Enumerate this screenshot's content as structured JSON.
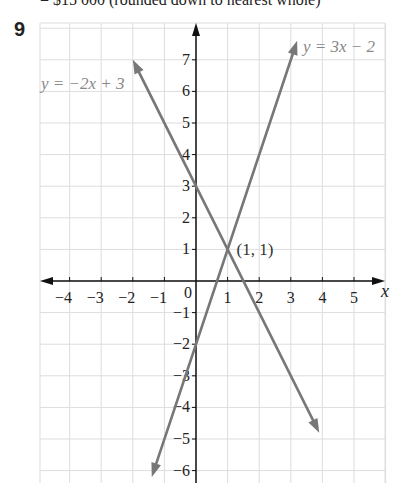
{
  "header": {
    "partial_text": "= $15 000 (rounded down to nearest whole)",
    "question_number": "9"
  },
  "chart_data": {
    "type": "line",
    "title": "",
    "xlabel": "x",
    "ylabel": "",
    "xlim": [
      -4.5,
      5.5
    ],
    "ylim": [
      -6.3,
      7.8
    ],
    "grid": true,
    "x_ticks": [
      -4,
      -3,
      -2,
      -1,
      1,
      2,
      3,
      4,
      5
    ],
    "y_ticks": [
      -6,
      -5,
      -4,
      -3,
      -2,
      -1,
      1,
      2,
      3,
      4,
      5,
      6,
      7
    ],
    "origin_label": "0",
    "series": [
      {
        "name": "y = -2x + 3",
        "slope": -2,
        "intercept": 3,
        "x": [
          -2,
          3.9
        ],
        "y": [
          7,
          -4.8
        ]
      },
      {
        "name": "y = 3x - 2",
        "slope": 3,
        "intercept": -2,
        "x": [
          -1.4,
          3.2
        ],
        "y": [
          -6.2,
          7.6
        ]
      }
    ],
    "annotations": [
      {
        "text": "(1, 1)",
        "x": 1,
        "y": 1
      }
    ],
    "labels": {
      "line1": "y = −2x + 3",
      "line2": "y = 3x − 2",
      "point": "(1, 1)"
    }
  }
}
